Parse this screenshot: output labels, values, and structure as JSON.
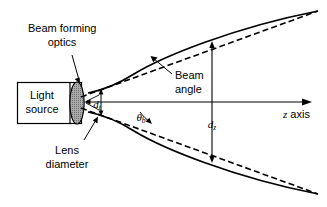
{
  "figure": {
    "background_color": "#ffffff",
    "line_color": "#000000",
    "lens_fill_color": "#9a9a9a",
    "width": 327,
    "height": 207
  },
  "labels": {
    "beam_forming_optics_line1": "Beam forming",
    "beam_forming_optics_line2": "optics",
    "light_source_line1": "Light",
    "light_source_line2": "source",
    "lens_diameter_line1": "Lens",
    "lens_diameter_line2": "diameter",
    "beam_angle_line1": "Beam",
    "beam_angle_line2": "angle",
    "z_axis": "z axis"
  },
  "symbols": {
    "theta_b_base": "θ",
    "theta_b_sub": "b",
    "d_t_base": "d",
    "d_t_sub": "t",
    "d_z_base": "d",
    "d_z_sub": "z"
  },
  "chart_data": {
    "type": "diagram",
    "elements": [
      {
        "name": "light-source-box",
        "shape": "rectangle",
        "x": 17,
        "y": 82,
        "width": 65,
        "height": 42
      },
      {
        "name": "light-source-inner-divider",
        "shape": "vertical-line",
        "x": 70,
        "y1": 82,
        "y2": 124
      },
      {
        "name": "lens",
        "shape": "ellipse",
        "cx": 77,
        "cy": 103,
        "rx": 7,
        "ry": 21,
        "fill": "#9a9a9a"
      },
      {
        "name": "z-axis",
        "shape": "arrow-horizontal",
        "x1": 86,
        "y1": 102,
        "x2": 311,
        "y2": 102
      },
      {
        "name": "beam-envelope-upper",
        "shape": "hyperbola-branch",
        "from": [
          88,
          93
        ],
        "to": [
          318,
          12
        ]
      },
      {
        "name": "beam-envelope-lower",
        "shape": "hyperbola-branch",
        "from": [
          88,
          112
        ],
        "to": [
          318,
          192
        ]
      },
      {
        "name": "asymptote-upper",
        "shape": "dashed-line",
        "from": [
          80,
          96
        ],
        "to": [
          318,
          12
        ]
      },
      {
        "name": "asymptote-lower",
        "shape": "dashed-line",
        "from": [
          80,
          109
        ],
        "to": [
          318,
          192
        ]
      },
      {
        "name": "waist-dimension",
        "shape": "double-arrow-vertical",
        "x": 101,
        "y1": 90,
        "y2": 116,
        "label": "d_t"
      },
      {
        "name": "far-field-dimension",
        "shape": "double-arrow-vertical",
        "x": 212,
        "y1": 42,
        "y2": 162,
        "label": "d_z"
      },
      {
        "name": "beam-angle-indicator",
        "shape": "angle-arc",
        "vertex": [
          88,
          102
        ],
        "label": "theta_b"
      }
    ],
    "annotations": [
      {
        "text": "Beam forming optics",
        "x": 30,
        "y": 34,
        "leader_to": [
          75,
          80
        ]
      },
      {
        "text": "Light source",
        "x": 34,
        "y": 96
      },
      {
        "text": "Lens diameter",
        "x": 47,
        "y": 146,
        "leader_to": [
          95,
          118
        ]
      },
      {
        "text": "Beam angle",
        "x": 172,
        "y": 78,
        "leader_to": [
          150,
          60
        ]
      },
      {
        "text": "z axis",
        "x": 285,
        "y": 116
      }
    ]
  }
}
